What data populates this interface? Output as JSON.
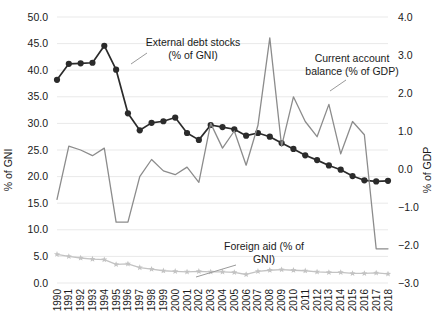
{
  "chart_data": {
    "type": "line",
    "title": "",
    "xlabel": "",
    "ylabel": "% of GNI",
    "y2label": "% of GDP",
    "grid": true,
    "legend_position": "inline-annotations",
    "x": [
      "1990",
      "1991",
      "1992",
      "1993",
      "1994",
      "1995",
      "1996",
      "1997",
      "1998",
      "1999",
      "2000",
      "2001",
      "2002",
      "2003",
      "2004",
      "2005",
      "2006",
      "2007",
      "2008",
      "2009",
      "2010",
      "2011",
      "2012",
      "2013",
      "2014",
      "2015",
      "2016",
      "2017",
      "2018"
    ],
    "ylim": [
      0.0,
      50.0
    ],
    "yticks": [
      "0.0",
      "5.0",
      "10.0",
      "15.0",
      "20.0",
      "25.0",
      "30.0",
      "35.0",
      "40.0",
      "45.0",
      "50.0"
    ],
    "y2lim": [
      -3.0,
      4.0
    ],
    "y2ticks": [
      "-3.0",
      "-2.0",
      "-1.0",
      "0.0",
      "1.0",
      "2.0",
      "3.0",
      "4.0"
    ],
    "series": [
      {
        "name": "External debt stocks (% of GNI)",
        "axis": "left",
        "color": "#2b2b2b",
        "marker": "circle",
        "values": [
          38.2,
          41.2,
          41.3,
          41.4,
          44.6,
          40.1,
          31.9,
          28.7,
          30.1,
          30.4,
          31.1,
          28.2,
          26.9,
          29.7,
          29.3,
          28.9,
          27.7,
          28.2,
          27.5,
          26.3,
          25.2,
          24.0,
          23.1,
          22.1,
          21.3,
          20.1,
          19.3,
          19.1,
          19.2
        ]
      },
      {
        "name": "Current account balance (% of GDP)",
        "axis": "right",
        "color": "#8c8c8c",
        "marker": "none",
        "values": [
          -0.8,
          0.6,
          0.5,
          0.35,
          0.55,
          -1.4,
          -1.4,
          -0.2,
          0.25,
          -0.05,
          -0.15,
          0.05,
          -0.35,
          1.2,
          0.55,
          1.0,
          0.1,
          1.15,
          3.45,
          0.6,
          1.9,
          1.25,
          0.85,
          1.7,
          0.4,
          1.25,
          0.9,
          -2.1,
          -2.1
        ]
      },
      {
        "name": "Foreign aid (% of GNI)",
        "axis": "left",
        "color": "#c3c3c3",
        "marker": "star",
        "values": [
          5.4,
          5.0,
          4.7,
          4.5,
          4.4,
          3.5,
          3.6,
          2.9,
          2.6,
          2.3,
          2.2,
          2.1,
          2.2,
          2.1,
          2.1,
          2.0,
          1.6,
          2.2,
          2.4,
          2.5,
          2.4,
          2.3,
          2.1,
          2.0,
          2.0,
          1.8,
          1.8,
          1.9,
          1.7
        ]
      }
    ],
    "annotations": [
      {
        "id": "external-debt",
        "line1": "External debt stocks",
        "line2": "(% of GNI)"
      },
      {
        "id": "current-account",
        "line1": "Current account",
        "line2": "balance (% of GDP)"
      },
      {
        "id": "foreign-aid",
        "line1": "Foreign aid (% of",
        "line2": "GNI)"
      }
    ],
    "colors": {
      "external_debt": "#2b2b2b",
      "current_account": "#8c8c8c",
      "foreign_aid": "#c3c3c3",
      "grid": "#e9e9e9",
      "text": "#1a1a1a"
    }
  }
}
